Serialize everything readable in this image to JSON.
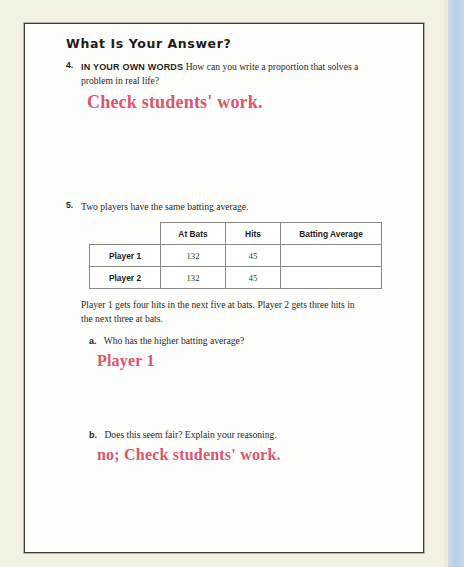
{
  "page": {
    "section_heading": "What Is Your Answer?"
  },
  "exercise4": {
    "number": "4.",
    "callout": "IN YOUR OWN WORDS",
    "prompt": "How can you write a proportion that solves a problem in real life?",
    "answer": "Check students' work."
  },
  "exercise5": {
    "number": "5.",
    "prompt": "Two players have the same batting average.",
    "table": {
      "corner": "",
      "columns": [
        "At Bats",
        "Hits",
        "Batting Average"
      ],
      "rows": [
        {
          "label": "Player 1",
          "at_bats": "132",
          "hits": "45",
          "batting_average": ""
        },
        {
          "label": "Player 2",
          "at_bats": "132",
          "hits": "45",
          "batting_average": ""
        }
      ]
    },
    "followup": "Player 1 gets four hits in the next five at bats. Player 2 gets three hits in the next three at bats.",
    "parts": [
      {
        "letter": "a.",
        "question": "Who has the higher batting average?",
        "answer": "Player 1"
      },
      {
        "letter": "b.",
        "question": "Does this seem fair? Explain your reasoning.",
        "answer": "no; Check students' work."
      }
    ]
  },
  "colors": {
    "answer_ink": "#d9566f",
    "page_background": "#fdfdfb",
    "scan_background": "#f3f1e2",
    "edge_strip": "#b9cee4"
  }
}
